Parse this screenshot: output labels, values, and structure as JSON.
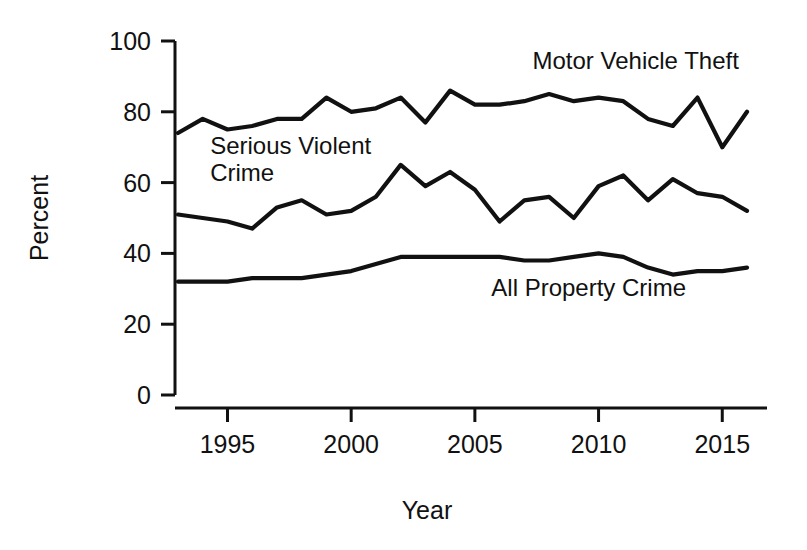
{
  "chart_data": {
    "type": "line",
    "title": "",
    "xlabel": "Year",
    "ylabel": "Percent",
    "xlim": [
      1993,
      2016
    ],
    "ylim": [
      0,
      100
    ],
    "grid": false,
    "legend_position": "inline-annotations",
    "x": [
      1993,
      1994,
      1995,
      1996,
      1997,
      1998,
      1999,
      2000,
      2001,
      2002,
      2003,
      2004,
      2005,
      2006,
      2007,
      2008,
      2009,
      2010,
      2011,
      2012,
      2013,
      2014,
      2015,
      2016
    ],
    "xticks": [
      1995,
      2000,
      2005,
      2010,
      2015
    ],
    "xtick_labels": [
      "1995",
      "2000",
      "2005",
      "2010",
      "2015"
    ],
    "yticks": [
      0,
      20,
      40,
      60,
      80,
      100
    ],
    "ytick_labels": [
      "0",
      "20",
      "40",
      "60",
      "80",
      "100"
    ],
    "series": [
      {
        "name": "Motor Vehicle Theft",
        "label_x": 2011.5,
        "label_y": 92,
        "values": [
          74,
          78,
          75,
          76,
          78,
          78,
          84,
          80,
          81,
          84,
          77,
          86,
          82,
          82,
          83,
          85,
          83,
          84,
          83,
          78,
          76,
          84,
          70,
          80
        ]
      },
      {
        "name": "Serious Violent Crime",
        "label_x": 1994.3,
        "label_y": 68,
        "label_lines": [
          "Serious Violent",
          "Crime"
        ],
        "values": [
          51,
          50,
          49,
          47,
          53,
          55,
          51,
          52,
          56,
          65,
          59,
          63,
          58,
          49,
          55,
          56,
          50,
          59,
          62,
          55,
          61,
          57,
          56,
          52
        ]
      },
      {
        "name": "All Property Crime",
        "label_x": 2009.6,
        "label_y": 28,
        "values": [
          32,
          32,
          32,
          33,
          33,
          33,
          34,
          35,
          37,
          39,
          39,
          39,
          39,
          39,
          38,
          38,
          39,
          40,
          39,
          36,
          34,
          35,
          35,
          36
        ]
      }
    ]
  },
  "axes": {
    "y_title": "Percent",
    "x_title": "Year"
  }
}
